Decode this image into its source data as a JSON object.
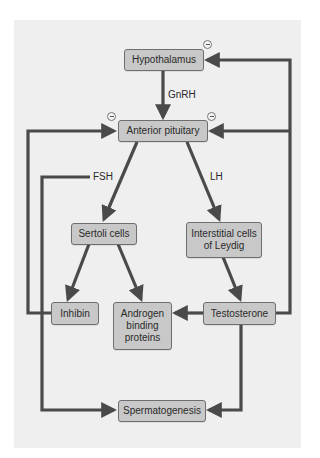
{
  "diagram": {
    "nodes": {
      "hypothalamus": "Hypothalamus",
      "anterior_pituitary": "Anterior pituitary",
      "sertoli_cells": "Sertoli cells",
      "interstitial_cells": "Interstitial cells of Leydig",
      "inhibin": "Inhibin",
      "androgen_binding_proteins": "Androgen binding proteins",
      "testosterone": "Testosterone",
      "spermatogenesis": "Spermatogenesis"
    },
    "labels": {
      "gnrh": "GnRH",
      "fsh": "FSH",
      "lh": "LH"
    },
    "inhibition_symbol": "negative-feedback-icon",
    "colors": {
      "panel": "#efefef",
      "box_fill": "#c8c8c8",
      "box_border": "#6e6e6e",
      "arrow": "#4a4a4a"
    }
  }
}
